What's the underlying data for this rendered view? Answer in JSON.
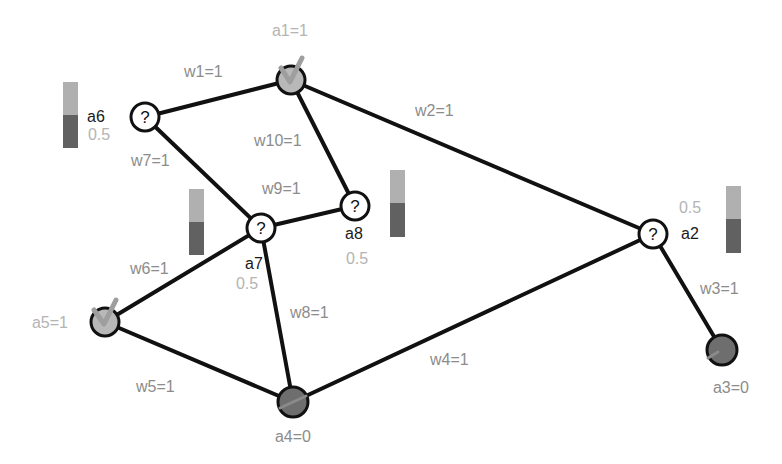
{
  "diagram": {
    "type": "network",
    "nodes": [
      {
        "id": "a1",
        "label": "a1=1",
        "state": "on",
        "x": 291,
        "y": 80
      },
      {
        "id": "a2",
        "label": "a2",
        "value": "0.5",
        "state": "unknown",
        "x": 653,
        "y": 234
      },
      {
        "id": "a3",
        "label": "a3=0",
        "state": "off",
        "x": 722,
        "y": 350
      },
      {
        "id": "a4",
        "label": "a4=0",
        "state": "off",
        "x": 293,
        "y": 402
      },
      {
        "id": "a5",
        "label": "a5=1",
        "state": "on",
        "x": 105,
        "y": 322
      },
      {
        "id": "a6",
        "label": "a6",
        "value": "0.5",
        "state": "unknown",
        "x": 145,
        "y": 117
      },
      {
        "id": "a7",
        "label": "a7",
        "value": "0.5",
        "state": "unknown",
        "x": 261,
        "y": 228
      },
      {
        "id": "a8",
        "label": "a8",
        "value": "0.5",
        "state": "unknown",
        "x": 355,
        "y": 206
      }
    ],
    "edges": [
      {
        "id": "w1",
        "label": "w1=1",
        "from": "a6",
        "to": "a1"
      },
      {
        "id": "w2",
        "label": "w2=1",
        "from": "a1",
        "to": "a2"
      },
      {
        "id": "w3",
        "label": "w3=1",
        "from": "a2",
        "to": "a3"
      },
      {
        "id": "w4",
        "label": "w4=1",
        "from": "a4",
        "to": "a2"
      },
      {
        "id": "w5",
        "label": "w5=1",
        "from": "a5",
        "to": "a4"
      },
      {
        "id": "w6",
        "label": "w6=1",
        "from": "a5",
        "to": "a7"
      },
      {
        "id": "w7",
        "label": "w7=1",
        "from": "a6",
        "to": "a7"
      },
      {
        "id": "w8",
        "label": "w8=1",
        "from": "a7",
        "to": "a4"
      },
      {
        "id": "w9",
        "label": "w9=1",
        "from": "a7",
        "to": "a8"
      },
      {
        "id": "w10",
        "label": "w10=1",
        "from": "a1",
        "to": "a8"
      }
    ],
    "unknown_symbol": "?",
    "colors": {
      "edge": "#111111",
      "weight_label": "#8c8c8c",
      "node_label": "#1a1a1a",
      "value_label": "#b4b4b4",
      "on_node": "#b8b8b8",
      "off_node": "#6e6e6e",
      "bar_top": "#b0b0b0",
      "bar_bottom": "#616161"
    }
  }
}
